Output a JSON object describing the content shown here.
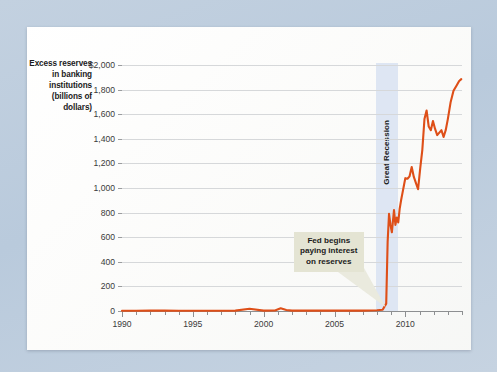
{
  "figure": {
    "y_axis_title_lines": [
      "Excess reserves",
      "in banking",
      "institutions",
      "(billions of",
      "dollars)"
    ],
    "line_color": "#de4f18",
    "band_color": "#dee6f3",
    "callout_color": "#e4e4d3",
    "page_background": "#bdcddd",
    "card_background": "#fdfdfc"
  },
  "annotations": {
    "recession_label": "Great Recession",
    "callout_line1": "Fed begins",
    "callout_line2": "paying interest",
    "callout_line3": "on reserves"
  },
  "chart_data": {
    "type": "line",
    "title": "",
    "subtitle": "",
    "xlabel": "",
    "ylabel": "Excess reserves in banking institutions (billions of dollars)",
    "xlim": [
      1990,
      2014
    ],
    "ylim": [
      0,
      2000
    ],
    "grid": true,
    "legend": "none",
    "y_ticks": [
      0,
      200,
      400,
      600,
      800,
      1000,
      1200,
      1400,
      1600,
      1800,
      2000
    ],
    "y_tick_labels": [
      "0",
      "200",
      "400",
      "600",
      "800",
      "1,000",
      "1,200",
      "1,400",
      "1,600",
      "1,800",
      "$2,000"
    ],
    "x_ticks_major": [
      1990,
      1995,
      2000,
      2005,
      2010
    ],
    "x_tick_labels": [
      "1990",
      "1995",
      "2000",
      "2005",
      "2010"
    ],
    "x_ticks_minor": [
      1991,
      1992,
      1993,
      1994,
      1996,
      1997,
      1998,
      1999,
      2001,
      2002,
      2003,
      2004,
      2006,
      2007,
      2008,
      2009,
      2011,
      2012,
      2013,
      2014
    ],
    "series": [
      {
        "name": "Excess reserves",
        "color": "#de4f18",
        "x": [
          1990.0,
          1991.0,
          1992.0,
          1993.0,
          1994.0,
          1995.0,
          1996.0,
          1997.0,
          1998.0,
          1999.0,
          2000.0,
          2000.8,
          2001.2,
          2001.6,
          2002.0,
          2003.0,
          2004.0,
          2005.0,
          2006.0,
          2007.0,
          2007.5,
          2008.0,
          2008.4,
          2008.65,
          2008.75,
          2008.85,
          2008.95,
          2009.05,
          2009.2,
          2009.3,
          2009.4,
          2009.5,
          2009.6,
          2009.7,
          2009.8,
          2009.9,
          2010.0,
          2010.15,
          2010.3,
          2010.45,
          2010.6,
          2010.75,
          2010.9,
          2011.05,
          2011.2,
          2011.35,
          2011.5,
          2011.65,
          2011.8,
          2011.95,
          2012.1,
          2012.25,
          2012.4,
          2012.55,
          2012.7,
          2012.85,
          2013.0,
          2013.2,
          2013.4,
          2013.6,
          2013.8,
          2013.95
        ],
        "y": [
          2,
          2,
          3,
          3,
          2,
          2,
          2,
          2,
          3,
          18,
          3,
          4,
          22,
          8,
          3,
          3,
          3,
          3,
          3,
          3,
          4,
          6,
          10,
          60,
          560,
          790,
          700,
          640,
          820,
          700,
          760,
          720,
          830,
          900,
          960,
          1020,
          1080,
          1075,
          1095,
          1170,
          1090,
          1040,
          990,
          1160,
          1310,
          1560,
          1630,
          1500,
          1470,
          1545,
          1480,
          1430,
          1450,
          1470,
          1415,
          1470,
          1560,
          1700,
          1790,
          1830,
          1870,
          1885
        ]
      }
    ],
    "annotations": [
      {
        "text": "Great Recession",
        "type": "vspan_label",
        "x_start": 2007.92,
        "x_end": 2009.45
      },
      {
        "text": "Fed begins paying interest on reserves",
        "type": "callout",
        "points_to_x": 2008.62,
        "points_to_y": 30
      }
    ]
  }
}
